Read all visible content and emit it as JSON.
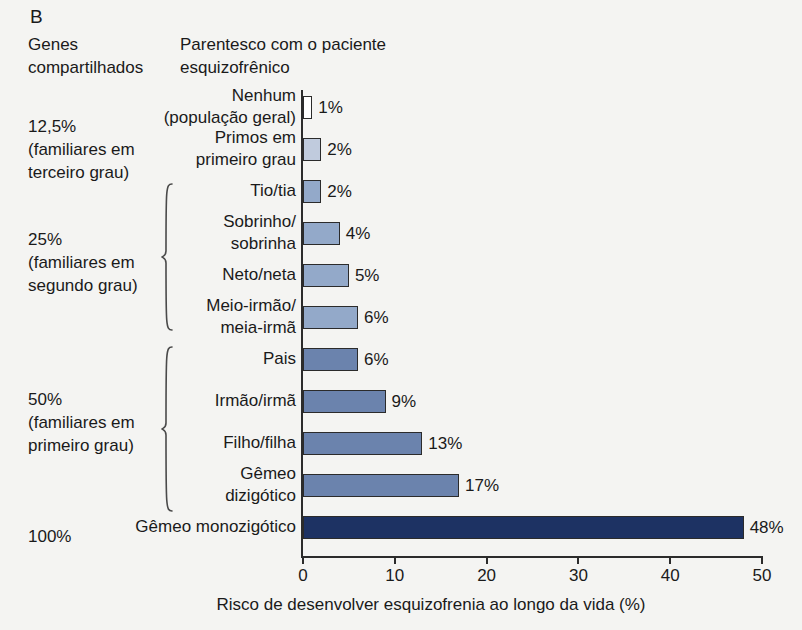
{
  "panel": {
    "letter": "B"
  },
  "headers": {
    "genes": "Genes\ncompartilhados",
    "relation": "Parentesco com o paciente\nesquizofrênico"
  },
  "groups": [
    {
      "label": "12,5%\n(familiares em\nterceiro grau)",
      "top": 115,
      "brace": null
    },
    {
      "label": "25%\n(familiares em\nsegundo grau)",
      "top": 228,
      "brace": {
        "top": 183,
        "height": 148
      }
    },
    {
      "label": "50%\n(familiares em\nprimeiro grau)",
      "top": 388,
      "brace": {
        "top": 346,
        "height": 166
      }
    },
    {
      "label": "100%",
      "top": 525,
      "brace": null
    }
  ],
  "chart_data": {
    "type": "bar",
    "orientation": "horizontal",
    "title": "Parentesco com o paciente esquizofrênico",
    "xlabel": "Risco de desenvolver esquizofrenia ao longo da vida (%)",
    "ylabel": "",
    "xlim": [
      0,
      50
    ],
    "xticks": [
      0,
      10,
      20,
      30,
      40,
      50
    ],
    "xtick_labels": [
      "0",
      "10",
      "20",
      "30",
      "40",
      "50"
    ],
    "grid": false,
    "legend": "none",
    "categories": [
      "Nenhum\n(população geral)",
      "Primos em\nprimeiro grau",
      "Tio/tia",
      "Sobrinho/\nsobrinha",
      "Neto/neta",
      "Meio-irmão/\nmeia-irmã",
      "Pais",
      "Irmão/irmã",
      "Filho/filha",
      "Gêmeo\ndizigótico",
      "Gêmeo monozigótico"
    ],
    "values": [
      1,
      2,
      2,
      4,
      5,
      6,
      6,
      9,
      13,
      17,
      48
    ],
    "value_labels": [
      "1%",
      "2%",
      "2%",
      "4%",
      "5%",
      "6%",
      "6%",
      "9%",
      "13%",
      "17%",
      "48%"
    ],
    "bar_colors": [
      "#ffffff",
      "#c0cbdd",
      "#93a9c9",
      "#93a9c9",
      "#93a9c9",
      "#93a9c9",
      "#6b83ad",
      "#6b83ad",
      "#6b83ad",
      "#6b83ad",
      "#1d3263"
    ]
  },
  "colors": {
    "background": "#f4f4f2",
    "outline": "#2b2b2b",
    "navy": "#1d3263",
    "slate": "#6b83ad",
    "steel": "#93a9c9",
    "pale": "#c0cbdd",
    "white": "#ffffff"
  }
}
